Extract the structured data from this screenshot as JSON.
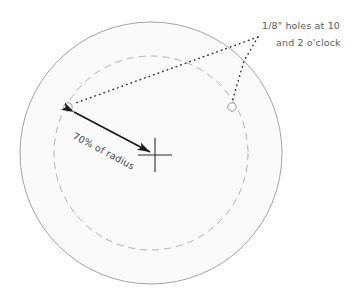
{
  "diagram": {
    "colors": {
      "disc_fill": "#fafafa",
      "disc_stroke": "#9a9a9a",
      "dashed_stroke": "#a8a8a8",
      "leader_stroke": "#3a3a3a",
      "arrow_stroke": "#1a1a1a",
      "hole_stroke": "#8a8a8a",
      "crosshair_stroke": "#2a2a2a",
      "annotation_text": "#5a5a5a",
      "dimension_text": "#4a4a4a",
      "background": "#ffffff"
    },
    "outer_circle": {
      "label": "disc-outline",
      "cx": 151,
      "cy": 153,
      "r": 131
    },
    "dashed_circle": {
      "label": "bolt-circle",
      "cx": 151,
      "cy": 153,
      "r": 97
    },
    "center_mark": {
      "label": "center-crosshair",
      "cx": 155,
      "cy": 155,
      "arm": 17
    },
    "holes": [
      {
        "label": "hole-10-oclock",
        "cx": 68,
        "cy": 107,
        "r": 4.2,
        "clock_position": "10 o'clock"
      },
      {
        "label": "hole-2-oclock",
        "cx": 232,
        "cy": 107,
        "r": 4.2,
        "clock_position": "2 o'clock"
      }
    ],
    "leader": {
      "vertex_x": 258,
      "vertex_y": 37
    },
    "annotations": {
      "holes_note_line1": "1/8\" holes at 10",
      "holes_note_line2": "and 2 o'clock",
      "radius_dimension": "70% of radius"
    }
  }
}
